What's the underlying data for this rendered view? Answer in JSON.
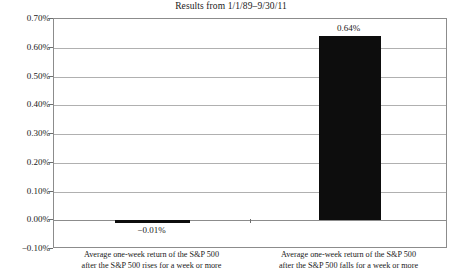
{
  "chart_data": {
    "type": "bar",
    "title": "Results from 1/1/89–9/30/11",
    "xlabel": "",
    "ylabel": "",
    "categories": [
      "Average one-week return of the S&P 500 after the S&P 500 rises for a week or more",
      "Average one-week return of the S&P 500 after the S&P 500 falls for a week or more"
    ],
    "category_lines": [
      {
        "line1": "Average one-week return of the S&P 500",
        "line2": "after the S&P 500 rises for a week or more"
      },
      {
        "line1": "Average one-week return of the S&P 500",
        "line2": "after the S&P 500 falls for a week or more"
      }
    ],
    "values": [
      -0.0001,
      0.0064
    ],
    "value_labels": [
      "−0.01%",
      "0.64%"
    ],
    "ylim": [
      -0.001,
      0.007
    ],
    "ytick_values": [
      0.007,
      0.006,
      0.005,
      0.004,
      0.003,
      0.002,
      0.001,
      0,
      -0.001
    ],
    "ytick_labels": [
      "0.70%",
      "0.60%",
      "0.50%",
      "0.40%",
      "0.30%",
      "0.20%",
      "0.10%",
      "0.00%",
      "−0.10%"
    ],
    "grid": true,
    "legend": null,
    "bar_color": "#0d0d0d",
    "background_color": "#ffffff",
    "axis_color": "#8c8c8c",
    "gridline_color": "#b0b0b0"
  }
}
